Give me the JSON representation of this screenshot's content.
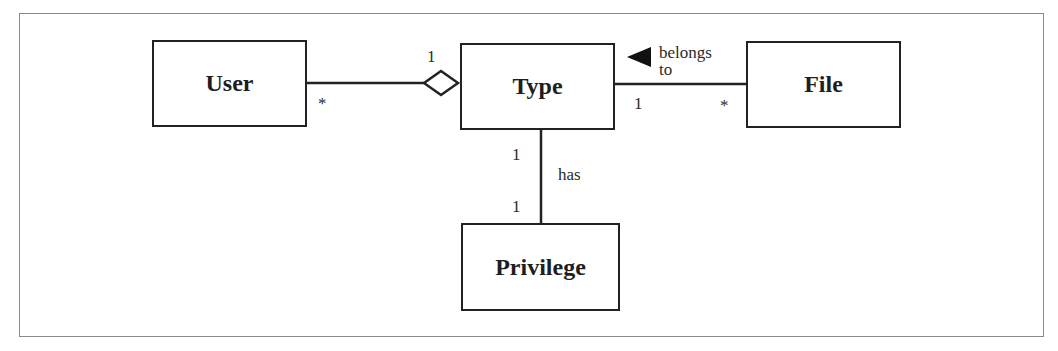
{
  "diagram": {
    "type": "UML class diagram",
    "classes": [
      {
        "id": "user",
        "name": "User"
      },
      {
        "id": "type",
        "name": "Type"
      },
      {
        "id": "file",
        "name": "File"
      },
      {
        "id": "privilege",
        "name": "Privilege"
      }
    ],
    "associations": [
      {
        "from": "user",
        "to": "type",
        "kind": "aggregation",
        "multiplicity_user": "*",
        "multiplicity_type": "1",
        "label": ""
      },
      {
        "from": "file",
        "to": "type",
        "kind": "association",
        "label": "belongs to",
        "label_line1": "belongs",
        "label_line2": "to",
        "direction_arrow": "toward-type",
        "multiplicity_type": "1",
        "multiplicity_file": "*"
      },
      {
        "from": "type",
        "to": "privilege",
        "kind": "association",
        "label": "has",
        "multiplicity_type": "1",
        "multiplicity_privilege": "1"
      }
    ]
  },
  "colors": {
    "line": "#222222",
    "frame": "#8a8a8a",
    "background": "#ffffff"
  }
}
